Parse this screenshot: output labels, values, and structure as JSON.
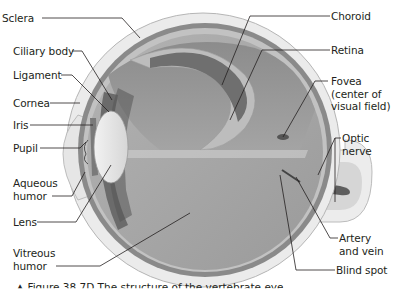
{
  "figure": {
    "caption_partial": "▲ Figure 38.7D  The structure of the vertebrate eye"
  },
  "colors": {
    "sclera": "#e9e9e9",
    "sclera_edge": "#b8b8b8",
    "choroid": "#7d7d7d",
    "retina": "#bdbdbd",
    "vitreous": "#a6a6a6",
    "vitreous_light": "#c4c4c4",
    "lens": "#e4e4e4",
    "leader_line": "#231f20",
    "text": "#231f20"
  },
  "labels_left": [
    {
      "id": "sclera",
      "text": "Sclera"
    },
    {
      "id": "ciliary-body",
      "text": "Ciliary body"
    },
    {
      "id": "ligament",
      "text": "Ligament"
    },
    {
      "id": "cornea",
      "text": "Cornea"
    },
    {
      "id": "iris",
      "text": "Iris"
    },
    {
      "id": "pupil",
      "text": "Pupil"
    },
    {
      "id": "aqueous-humor",
      "text": "Aqueous\nhumor"
    },
    {
      "id": "lens",
      "text": "Lens"
    },
    {
      "id": "vitreous-humor",
      "text": "Vitreous\nhumor"
    }
  ],
  "labels_right": [
    {
      "id": "choroid",
      "text": "Choroid"
    },
    {
      "id": "retina",
      "text": "Retina"
    },
    {
      "id": "fovea",
      "text": "Fovea\n(center of\nvisual field)"
    },
    {
      "id": "optic-nerve",
      "text": "Optic\nnerve"
    },
    {
      "id": "artery-and-vein",
      "text": "Artery\nand vein"
    },
    {
      "id": "blind-spot",
      "text": "Blind spot"
    }
  ]
}
